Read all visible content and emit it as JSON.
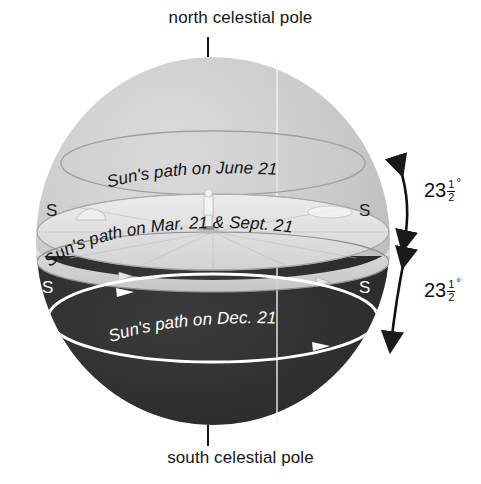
{
  "diagram": {
    "title_top": "north celestial pole",
    "title_bottom": "south celestial pole",
    "labels": {
      "june": "Sun's path on June 21",
      "equinox": "Sun's path on Mar. 21 & Sept. 21",
      "december": "Sun's path on Dec. 21"
    },
    "cardinal": {
      "upper_left": "S",
      "upper_right": "S",
      "lower_left": "S",
      "lower_right": "S"
    },
    "angles": [
      {
        "id": "tilt-upper",
        "integer": "23",
        "numerator": "1",
        "denominator": "2",
        "degree": "°",
        "full": "23 1/2°"
      },
      {
        "id": "tilt-lower",
        "integer": "23",
        "numerator": "1",
        "denominator": "2",
        "degree": "°",
        "full": "23 1/2°"
      }
    ],
    "colors": {
      "background": "#ffffff",
      "upper_hemisphere": "#c9c9c9",
      "lower_hemisphere": "#2b2b2b",
      "horizon_plane": "#e3e3e3",
      "equinox_band": "#dcdcdc",
      "path_line_dark": "#3a3a3a",
      "path_line_light": "#ffffff",
      "text_dark": "#161616",
      "text_light": "#ffffff",
      "meridian": "#f2f2f2"
    },
    "geometry": {
      "sphere_center_x": 213,
      "sphere_center_y": 241,
      "sphere_radius": 177,
      "sphere_radius_y": 184
    },
    "observer": "standing-figure"
  }
}
